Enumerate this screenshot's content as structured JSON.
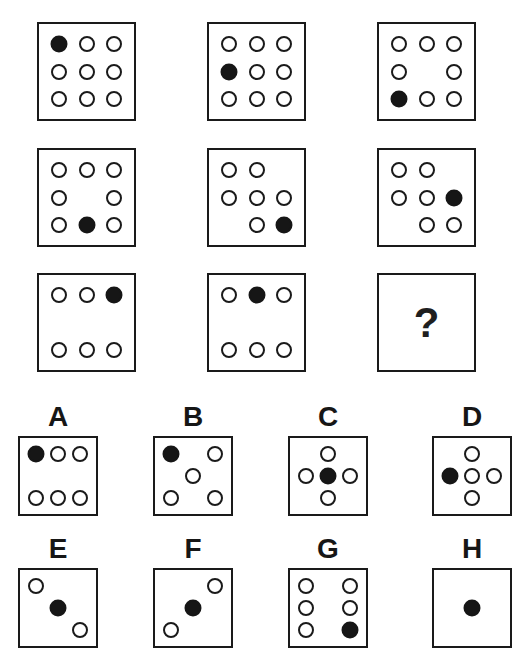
{
  "colors": {
    "line": "#1a1a1a",
    "fill": "#161616",
    "background": "#ffffff"
  },
  "matrix": {
    "question_mark": "?",
    "cells": [
      {
        "name": "matrix-cell-1",
        "circles": [
          {
            "r": 0,
            "c": 0,
            "f": 1
          },
          {
            "r": 0,
            "c": 1,
            "f": 0
          },
          {
            "r": 0,
            "c": 2,
            "f": 0
          },
          {
            "r": 1,
            "c": 0,
            "f": 0
          },
          {
            "r": 1,
            "c": 1,
            "f": 0
          },
          {
            "r": 1,
            "c": 2,
            "f": 0
          },
          {
            "r": 2,
            "c": 0,
            "f": 0
          },
          {
            "r": 2,
            "c": 1,
            "f": 0
          },
          {
            "r": 2,
            "c": 2,
            "f": 0
          }
        ]
      },
      {
        "name": "matrix-cell-2",
        "circles": [
          {
            "r": 0,
            "c": 0,
            "f": 0
          },
          {
            "r": 0,
            "c": 1,
            "f": 0
          },
          {
            "r": 0,
            "c": 2,
            "f": 0
          },
          {
            "r": 1,
            "c": 0,
            "f": 1
          },
          {
            "r": 1,
            "c": 1,
            "f": 0
          },
          {
            "r": 1,
            "c": 2,
            "f": 0
          },
          {
            "r": 2,
            "c": 0,
            "f": 0
          },
          {
            "r": 2,
            "c": 1,
            "f": 0
          },
          {
            "r": 2,
            "c": 2,
            "f": 0
          }
        ]
      },
      {
        "name": "matrix-cell-3",
        "circles": [
          {
            "r": 0,
            "c": 0,
            "f": 0
          },
          {
            "r": 0,
            "c": 1,
            "f": 0
          },
          {
            "r": 0,
            "c": 2,
            "f": 0
          },
          {
            "r": 1,
            "c": 0,
            "f": 0
          },
          {
            "r": 1,
            "c": 2,
            "f": 0
          },
          {
            "r": 2,
            "c": 0,
            "f": 1
          },
          {
            "r": 2,
            "c": 1,
            "f": 0
          },
          {
            "r": 2,
            "c": 2,
            "f": 0
          }
        ]
      },
      {
        "name": "matrix-cell-4",
        "circles": [
          {
            "r": 0,
            "c": 0,
            "f": 0
          },
          {
            "r": 0,
            "c": 1,
            "f": 0
          },
          {
            "r": 0,
            "c": 2,
            "f": 0
          },
          {
            "r": 1,
            "c": 0,
            "f": 0
          },
          {
            "r": 1,
            "c": 2,
            "f": 0
          },
          {
            "r": 2,
            "c": 0,
            "f": 0
          },
          {
            "r": 2,
            "c": 1,
            "f": 1
          },
          {
            "r": 2,
            "c": 2,
            "f": 0
          }
        ]
      },
      {
        "name": "matrix-cell-5",
        "circles": [
          {
            "r": 0,
            "c": 0,
            "f": 0
          },
          {
            "r": 0,
            "c": 1,
            "f": 0
          },
          {
            "r": 1,
            "c": 0,
            "f": 0
          },
          {
            "r": 1,
            "c": 1,
            "f": 0
          },
          {
            "r": 1,
            "c": 2,
            "f": 0
          },
          {
            "r": 2,
            "c": 1,
            "f": 0
          },
          {
            "r": 2,
            "c": 2,
            "f": 1
          }
        ]
      },
      {
        "name": "matrix-cell-6",
        "circles": [
          {
            "r": 0,
            "c": 0,
            "f": 0
          },
          {
            "r": 0,
            "c": 1,
            "f": 0
          },
          {
            "r": 1,
            "c": 0,
            "f": 0
          },
          {
            "r": 1,
            "c": 1,
            "f": 0
          },
          {
            "r": 1,
            "c": 2,
            "f": 1
          },
          {
            "r": 2,
            "c": 1,
            "f": 0
          },
          {
            "r": 2,
            "c": 2,
            "f": 0
          }
        ]
      },
      {
        "name": "matrix-cell-7",
        "circles": [
          {
            "r": 0,
            "c": 0,
            "f": 0
          },
          {
            "r": 0,
            "c": 1,
            "f": 0
          },
          {
            "r": 0,
            "c": 2,
            "f": 1
          },
          {
            "r": 2,
            "c": 0,
            "f": 0
          },
          {
            "r": 2,
            "c": 1,
            "f": 0
          },
          {
            "r": 2,
            "c": 2,
            "f": 0
          }
        ]
      },
      {
        "name": "matrix-cell-8",
        "circles": [
          {
            "r": 0,
            "c": 0,
            "f": 0
          },
          {
            "r": 0,
            "c": 1,
            "f": 1
          },
          {
            "r": 0,
            "c": 2,
            "f": 0
          },
          {
            "r": 2,
            "c": 0,
            "f": 0
          },
          {
            "r": 2,
            "c": 1,
            "f": 0
          },
          {
            "r": 2,
            "c": 2,
            "f": 0
          }
        ]
      },
      {
        "name": "matrix-cell-9",
        "question": true
      }
    ]
  },
  "options": [
    {
      "label": "A",
      "circles": [
        {
          "r": 0,
          "c": 0,
          "f": 1
        },
        {
          "r": 0,
          "c": 1,
          "f": 0
        },
        {
          "r": 0,
          "c": 2,
          "f": 0
        },
        {
          "r": 2,
          "c": 0,
          "f": 0
        },
        {
          "r": 2,
          "c": 1,
          "f": 0
        },
        {
          "r": 2,
          "c": 2,
          "f": 0
        }
      ]
    },
    {
      "label": "B",
      "circles": [
        {
          "r": 0,
          "c": 0,
          "f": 1
        },
        {
          "r": 0,
          "c": 2,
          "f": 0
        },
        {
          "r": 1,
          "c": 1,
          "f": 0
        },
        {
          "r": 2,
          "c": 0,
          "f": 0
        },
        {
          "r": 2,
          "c": 2,
          "f": 0
        }
      ]
    },
    {
      "label": "C",
      "circles": [
        {
          "r": 0,
          "c": 1,
          "f": 0
        },
        {
          "r": 1,
          "c": 0,
          "f": 0
        },
        {
          "r": 1,
          "c": 1,
          "f": 1
        },
        {
          "r": 1,
          "c": 2,
          "f": 0
        },
        {
          "r": 2,
          "c": 1,
          "f": 0
        }
      ]
    },
    {
      "label": "D",
      "circles": [
        {
          "r": 0,
          "c": 1,
          "f": 0
        },
        {
          "r": 1,
          "c": 0,
          "f": 1
        },
        {
          "r": 1,
          "c": 1,
          "f": 0
        },
        {
          "r": 1,
          "c": 2,
          "f": 0
        },
        {
          "r": 2,
          "c": 1,
          "f": 0
        }
      ]
    },
    {
      "label": "E",
      "circles": [
        {
          "r": 0,
          "c": 0,
          "f": 0
        },
        {
          "r": 1,
          "c": 1,
          "f": 1
        },
        {
          "r": 2,
          "c": 2,
          "f": 0
        }
      ]
    },
    {
      "label": "F",
      "circles": [
        {
          "r": 0,
          "c": 2,
          "f": 0
        },
        {
          "r": 1,
          "c": 1,
          "f": 1
        },
        {
          "r": 2,
          "c": 0,
          "f": 0
        }
      ]
    },
    {
      "label": "G",
      "circles": [
        {
          "r": 0,
          "c": 0,
          "f": 0
        },
        {
          "r": 0,
          "c": 2,
          "f": 0
        },
        {
          "r": 1,
          "c": 0,
          "f": 0
        },
        {
          "r": 1,
          "c": 2,
          "f": 0
        },
        {
          "r": 2,
          "c": 0,
          "f": 0
        },
        {
          "r": 2,
          "c": 2,
          "f": 1
        }
      ]
    },
    {
      "label": "H",
      "circles": [
        {
          "r": 1,
          "c": 1,
          "f": 1
        }
      ]
    }
  ]
}
